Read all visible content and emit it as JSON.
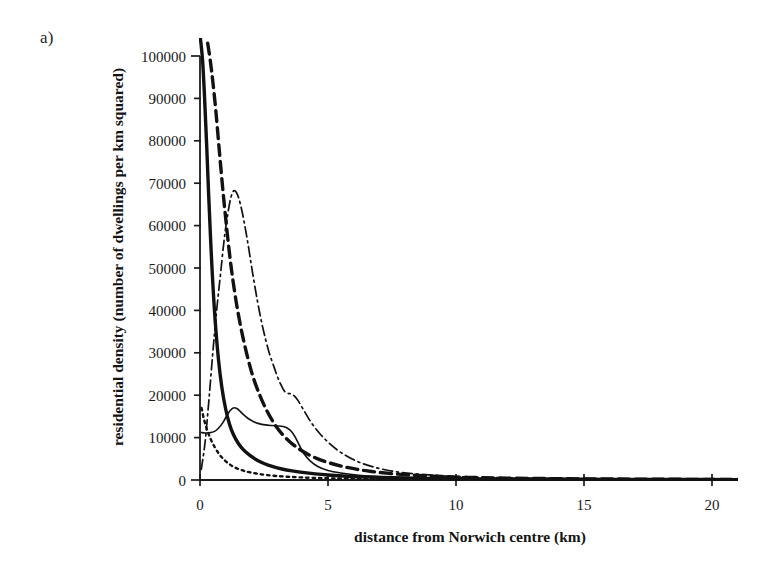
{
  "panel": {
    "label": "a)"
  },
  "chart_data": {
    "type": "line",
    "title": "",
    "xlabel": "distance from Norwich centre (km)",
    "ylabel": "residential density (number of dwellings per km squared)",
    "xlim": [
      0,
      21.0
    ],
    "ylim": [
      0,
      100000
    ],
    "xticks": [
      0,
      5,
      10,
      15,
      20
    ],
    "xticklabels": [
      "0",
      "5",
      "10",
      "15",
      "20"
    ],
    "yticks": [
      0,
      10000,
      20000,
      30000,
      40000,
      50000,
      60000,
      70000,
      80000,
      90000,
      100000
    ],
    "yticklabels": [
      "0",
      "10000",
      "20000",
      "30000",
      "40000",
      "50000",
      "60000",
      "70000",
      "80000",
      "90000",
      "100000"
    ],
    "grid": false,
    "legend": "none",
    "axis_color": "#1b1b1b",
    "series": [
      {
        "name": "thick-solid",
        "style": "solid",
        "width": 3.4,
        "dash": "",
        "x": [
          0.02,
          0.1,
          0.18,
          0.26,
          0.34,
          0.42,
          0.5,
          0.6,
          0.72,
          0.85,
          1.0,
          1.15,
          1.3,
          1.5,
          1.7,
          1.95,
          2.2,
          2.5,
          2.85,
          3.2,
          3.6,
          4.0,
          4.5,
          5.0,
          5.6,
          6.2,
          7.0,
          8.0,
          9.5,
          11.0,
          13.0,
          15.0,
          17.0,
          19.0,
          21.0
        ],
        "y": [
          104000,
          99000,
          90000,
          79000,
          67000,
          56000,
          46500,
          37000,
          28500,
          22000,
          16800,
          13200,
          10800,
          8600,
          7100,
          5800,
          4800,
          3900,
          3150,
          2600,
          2150,
          1800,
          1450,
          1180,
          950,
          780,
          620,
          470,
          340,
          270,
          200,
          160,
          130,
          110,
          95
        ]
      },
      {
        "name": "thick-dashed",
        "style": "dashed",
        "width": 3.4,
        "dash": "11,6",
        "x": [
          0.3,
          0.4,
          0.5,
          0.62,
          0.75,
          0.9,
          1.05,
          1.2,
          1.35,
          1.5,
          1.7,
          1.9,
          2.1,
          2.35,
          2.6,
          2.9,
          3.2,
          3.55,
          3.9,
          4.3,
          4.7,
          5.1,
          5.6,
          6.1,
          6.7,
          7.4,
          8.2,
          9.2,
          10.5,
          12.0,
          14.0,
          16.0,
          18.0,
          20.0,
          21.0
        ],
        "y": [
          103000,
          99000,
          94000,
          87000,
          78000,
          68000,
          59000,
          51000,
          44500,
          39000,
          33000,
          28000,
          23800,
          19800,
          16500,
          13300,
          10900,
          8800,
          7200,
          5800,
          4750,
          3950,
          3150,
          2550,
          2000,
          1550,
          1180,
          880,
          620,
          450,
          310,
          230,
          180,
          140,
          125
        ]
      },
      {
        "name": "thin-dash-dot",
        "style": "dash-dot",
        "width": 1.7,
        "dash": "10,4,2,4",
        "x": [
          0.05,
          0.2,
          0.35,
          0.5,
          0.65,
          0.8,
          0.95,
          1.08,
          1.2,
          1.32,
          1.45,
          1.58,
          1.72,
          1.88,
          2.05,
          2.25,
          2.45,
          2.68,
          2.9,
          3.05,
          3.2,
          3.32,
          3.45,
          3.6,
          3.8,
          4.05,
          4.35,
          4.7,
          5.1,
          5.55,
          6.1,
          6.7,
          7.5,
          8.5,
          10.0,
          12.0,
          14.5,
          17.0,
          19.5,
          21.0
        ],
        "y": [
          2500,
          9000,
          19000,
          30000,
          40000,
          48500,
          57000,
          62500,
          66500,
          68200,
          67500,
          65000,
          61000,
          55500,
          49000,
          42000,
          36000,
          30500,
          26500,
          24000,
          22000,
          20800,
          20400,
          20200,
          19000,
          16500,
          13500,
          10800,
          8400,
          6300,
          4500,
          3200,
          2100,
          1400,
          820,
          500,
          330,
          240,
          180,
          160
        ]
      },
      {
        "name": "thin-solid",
        "style": "solid",
        "width": 1.6,
        "dash": "",
        "x": [
          0.05,
          0.2,
          0.38,
          0.55,
          0.72,
          0.9,
          1.05,
          1.18,
          1.3,
          1.42,
          1.55,
          1.7,
          1.88,
          2.08,
          2.3,
          2.55,
          2.8,
          3.05,
          3.25,
          3.42,
          3.58,
          3.72,
          3.88,
          4.05,
          4.3,
          4.6,
          5.0,
          5.5,
          6.1,
          6.8,
          7.8,
          9.0,
          10.5,
          12.5,
          15.0,
          17.5,
          20.0,
          21.0
        ],
        "y": [
          11200,
          11100,
          11150,
          11400,
          12200,
          13600,
          15200,
          16400,
          17000,
          16900,
          16300,
          15400,
          14500,
          13800,
          13300,
          13000,
          12850,
          12750,
          12600,
          12200,
          11400,
          10100,
          8200,
          6300,
          4500,
          3200,
          2250,
          1650,
          1180,
          850,
          580,
          420,
          310,
          220,
          160,
          130,
          110,
          100
        ]
      },
      {
        "name": "fine-dotted",
        "style": "dotted",
        "width": 2.4,
        "dash": "2.5,4",
        "x": [
          0.06,
          0.16,
          0.28,
          0.42,
          0.58,
          0.75,
          0.92,
          1.1,
          1.3,
          1.52,
          1.75,
          2.0,
          2.3,
          2.6,
          3.0,
          3.45,
          3.95,
          4.5,
          5.1,
          5.8,
          6.6,
          7.5,
          8.6,
          10.0,
          11.5,
          13.5,
          15.5,
          17.5,
          19.5,
          21.0
        ],
        "y": [
          17000,
          14200,
          11800,
          9600,
          7700,
          6100,
          4900,
          3950,
          3150,
          2550,
          2100,
          1750,
          1420,
          1180,
          940,
          760,
          610,
          490,
          400,
          330,
          270,
          225,
          185,
          150,
          125,
          105,
          90,
          80,
          72,
          68
        ]
      }
    ]
  }
}
